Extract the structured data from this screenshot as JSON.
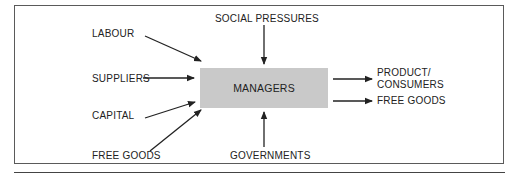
{
  "diagram": {
    "type": "flow",
    "center": {
      "label": "MANAGERS",
      "fill": "#c9c9c9"
    },
    "inputs": [
      {
        "id": "labour",
        "label": "LABOUR"
      },
      {
        "id": "suppliers",
        "label": "SUPPLIERS"
      },
      {
        "id": "capital",
        "label": "CAPITAL"
      },
      {
        "id": "free-goods-in",
        "label": "FREE GOODS"
      },
      {
        "id": "social-pressures",
        "label": "SOCIAL PRESSURES"
      },
      {
        "id": "governments",
        "label": "GOVERNMENTS"
      }
    ],
    "outputs": [
      {
        "id": "product-consumers",
        "label_line1": "PRODUCT/",
        "label_line2": "CONSUMERS"
      },
      {
        "id": "free-goods-out",
        "label": "FREE GOODS"
      }
    ],
    "edges": [
      {
        "from": "LABOUR",
        "to": "MANAGERS"
      },
      {
        "from": "SUPPLIERS",
        "to": "MANAGERS"
      },
      {
        "from": "CAPITAL",
        "to": "MANAGERS"
      },
      {
        "from": "FREE GOODS",
        "to": "MANAGERS"
      },
      {
        "from": "SOCIAL PRESSURES",
        "to": "MANAGERS"
      },
      {
        "from": "GOVERNMENTS",
        "to": "MANAGERS"
      },
      {
        "from": "MANAGERS",
        "to": "PRODUCT/ CONSUMERS"
      },
      {
        "from": "MANAGERS",
        "to": "FREE GOODS"
      }
    ],
    "colors": {
      "line": "#222222",
      "border": "#5a5a5a",
      "box": "#c9c9c9"
    }
  }
}
